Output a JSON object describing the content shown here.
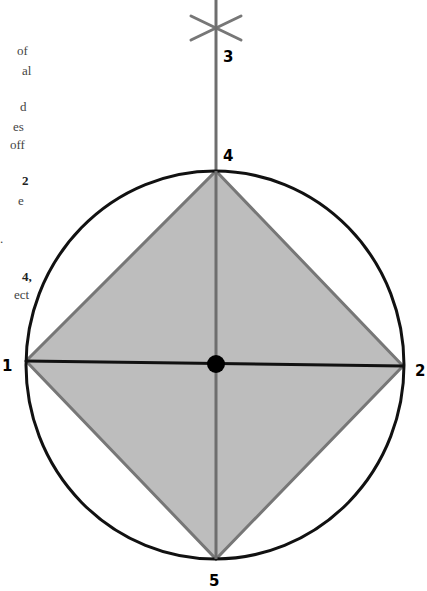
{
  "text_fragments": [
    {
      "text": "of",
      "x": 17,
      "y": 55
    },
    {
      "text": "al",
      "x": 22,
      "y": 75
    },
    {
      "text": "d",
      "x": 20,
      "y": 111
    },
    {
      "text": "es",
      "x": 13,
      "y": 131
    },
    {
      "text": "off",
      "x": 10,
      "y": 149
    },
    {
      "text": "2",
      "x": 22,
      "y": 185,
      "bold": true
    },
    {
      "text": "e",
      "x": 18,
      "y": 205
    },
    {
      "text": ".",
      "x": 0,
      "y": 243
    },
    {
      "text": "4,",
      "x": 22,
      "y": 281,
      "bold": true
    },
    {
      "text": "ect",
      "x": 14,
      "y": 299
    }
  ],
  "diagram": {
    "colors": {
      "fill": "#bdbdbd",
      "diamond_stroke": "#777777",
      "circle_stroke": "#111111",
      "axis_line": "#111111",
      "vertical_line": "#6e6e6e",
      "center_dot": "#000000"
    },
    "circle": {
      "cx": 215,
      "cy": 365,
      "rx": 189,
      "ry": 194
    },
    "center": {
      "x": 216,
      "y": 364,
      "r": 9
    },
    "points": {
      "1": {
        "x": 26,
        "y": 361
      },
      "2": {
        "x": 403,
        "y": 366
      },
      "3": {
        "x": 216,
        "y": 28
      },
      "4": {
        "x": 216,
        "y": 171
      },
      "5": {
        "x": 216,
        "y": 559
      }
    },
    "labels": [
      {
        "id": "1",
        "text": "1",
        "x": 2,
        "y": 371
      },
      {
        "id": "2",
        "text": "2",
        "x": 415,
        "y": 376
      },
      {
        "id": "3",
        "text": "3",
        "x": 223,
        "y": 62
      },
      {
        "id": "4",
        "text": "4",
        "x": 223,
        "y": 161
      },
      {
        "id": "5",
        "text": "5",
        "x": 209,
        "y": 586
      }
    ],
    "star": {
      "cx": 216,
      "cy": 28,
      "arm": 25
    }
  }
}
